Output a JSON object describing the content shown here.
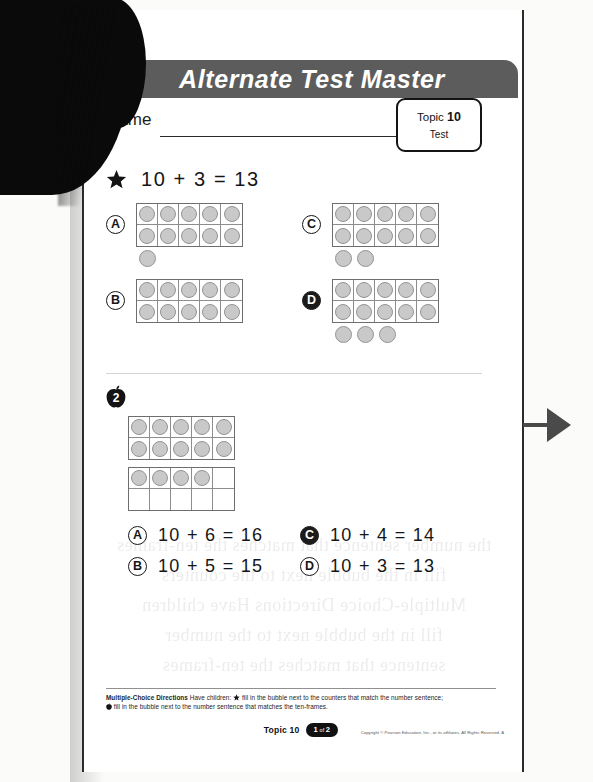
{
  "header": {
    "title": "Alternate Test Master"
  },
  "name_field": {
    "label": "Name",
    "value": ""
  },
  "topic_box": {
    "prefix": "Topic",
    "number": "10",
    "type": "Test"
  },
  "questions": [
    {
      "id": "q1",
      "marker_icon": "star-icon",
      "marker_label": "1",
      "prompt": "10 + 3 = 13",
      "answer_style": "counters",
      "options": [
        {
          "letter": "A",
          "selected": false,
          "ten_frame_filled": 10,
          "loose_counters": 1
        },
        {
          "letter": "C",
          "selected": false,
          "ten_frame_filled": 10,
          "loose_counters": 2
        },
        {
          "letter": "B",
          "selected": false,
          "ten_frame_filled": 10,
          "loose_counters": 0
        },
        {
          "letter": "D",
          "selected": true,
          "ten_frame_filled": 10,
          "loose_counters": 3
        }
      ]
    },
    {
      "id": "q2",
      "marker_icon": "apple-icon",
      "marker_label": "2",
      "prompt": "",
      "answer_style": "sentences",
      "frames": [
        {
          "filled": 10
        },
        {
          "filled": 4
        }
      ],
      "options": [
        {
          "letter": "A",
          "selected": false,
          "text": "10 + 6 = 16"
        },
        {
          "letter": "C",
          "selected": true,
          "text": "10 + 4 = 14"
        },
        {
          "letter": "B",
          "selected": false,
          "text": "10 + 5 = 15"
        },
        {
          "letter": "D",
          "selected": false,
          "text": "10 + 3 = 13"
        }
      ]
    }
  ],
  "footer": {
    "directions_title": "Multiple-Choice Directions",
    "directions_lead": "Have children:",
    "directions_line_1": "fill in the bubble next to the counters that match the number sentence;",
    "directions_line_2": "fill in the bubble next to the number sentence that matches the ten-frames.",
    "topic_label": "Topic 10",
    "page_current": "1",
    "page_of": "of",
    "page_total": "2",
    "copyright": "Copyright © Pearson Education, Inc., or its affiliates. All Rights Reserved. A"
  },
  "ghost_text": "scan bleed-through from reverse side of the page",
  "side_arrow": {
    "icon": "arrow-right-icon"
  },
  "colors": {
    "header_band": "#5c5c5c",
    "ink": "#161616",
    "counter_fill": "#c9c9c9",
    "frame_line": "#6e6e6e",
    "arrow": "#4a4a4a"
  }
}
